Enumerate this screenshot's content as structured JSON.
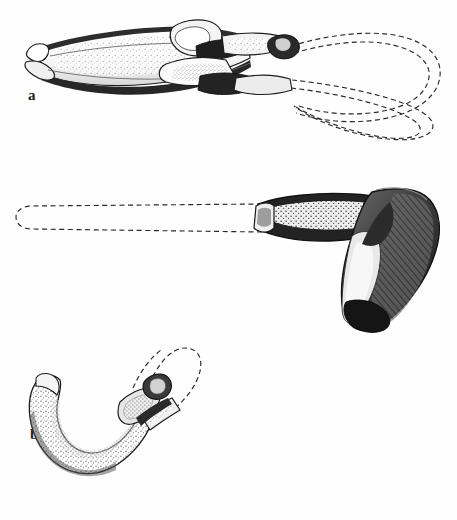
{
  "figure": {
    "kind": "archaeological-line-drawing",
    "background_color": "#fefefe",
    "ink_color": "#1d1d1d",
    "width": 457,
    "height": 520,
    "panel_count": 3
  },
  "panels": [
    {
      "id": "a",
      "label": "a",
      "subject": "adze hafted on elbow haft with looped reconstructed handle",
      "artifact_rendering": "stippled and hatched bone/antler blade with dark binding",
      "handle_rendering": "dashed outline, double loop",
      "label_position": {
        "x": 28,
        "y": 88
      }
    },
    {
      "id": "b",
      "label": "b",
      "subject": "dark stone adze head on long straight reconstructed handle",
      "artifact_rendering": "dense hatched dark blade with light socket collar",
      "handle_rendering": "dashed outline, straight shaft with rounded butt",
      "label_position": {
        "x": 30,
        "y": 257
      }
    },
    {
      "id": "c",
      "label": "c",
      "subject": "curved hook-shaped tool hafted with short reconstructed handle",
      "artifact_rendering": "stippled curved hook with bound haft collar",
      "handle_rendering": "dashed outline, short angled shaft with rounded end",
      "label_position": {
        "x": 30,
        "y": 477
      }
    }
  ],
  "colors": {
    "ink": "#1d1d1d",
    "mid_tone": "#5a5a5a",
    "light_tone": "#9a9a9a",
    "dark_fill": "#3a3a3a",
    "paper": "#fefefe"
  },
  "legend_note": {
    "solid_lines": "preserved artifact",
    "dashed_lines": "reconstructed wooden haft"
  }
}
